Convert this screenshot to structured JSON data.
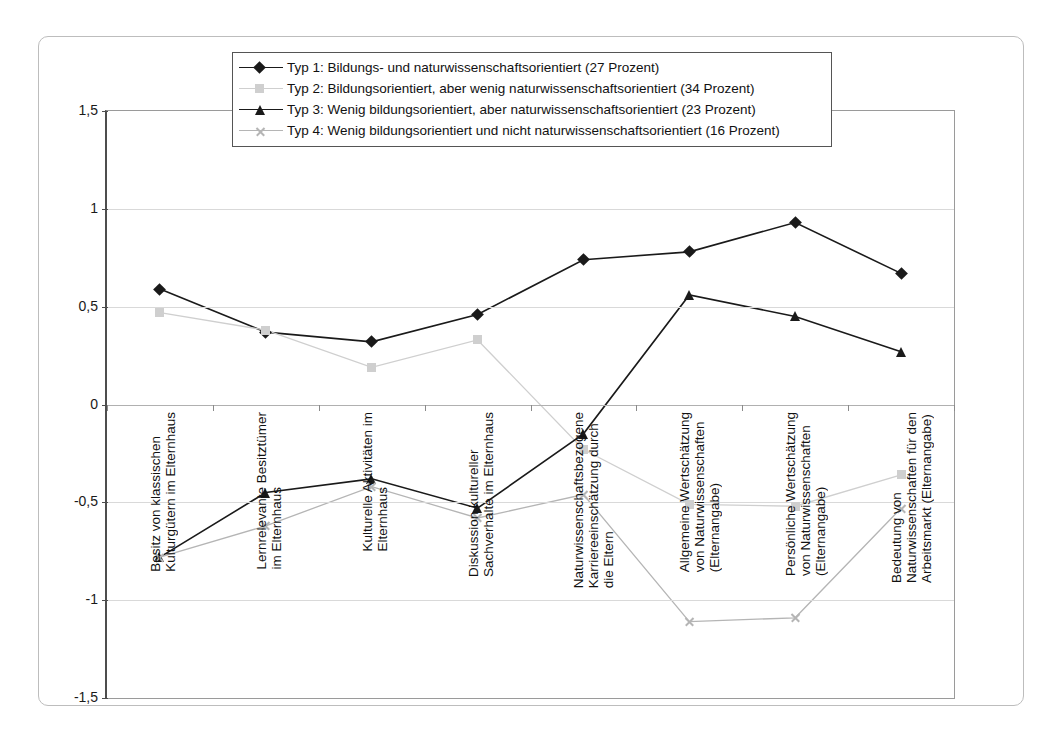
{
  "chart_data": {
    "type": "line",
    "title": "",
    "xlabel": "",
    "ylabel": "",
    "ylim": [
      -1.5,
      1.5
    ],
    "yticks": [
      "1,5",
      "1",
      "0,5",
      "0",
      "-0,5",
      "-1",
      "-1,5"
    ],
    "ytick_values": [
      1.5,
      1,
      0.5,
      0,
      -0.5,
      -1,
      -1.5
    ],
    "grid": true,
    "legend_position": "top",
    "categories": [
      "Besitz von klassischen\nKulturgütern im Elternhaus",
      "Lernrelevante Besitztümer\nim Elternhaus",
      "Kulturelle Aktivitäten im\nElternhaus",
      "Diskussion kultureller\nSachverhalte im Elternhaus",
      "Naturwissenschaftsbezogene\nKarriereeinschätzung durch\ndie Eltern",
      "Allgemeine Wertschätzung\nvon Naturwissenschaften\n(Elternangabe)",
      "Persönliche Wertschätzung\nvon Naturwissenschaften\n(Elternangabe)",
      "Bedeutung von\nNaturwissenschaften für den\nArbeitsmarkt (Elternangabe)"
    ],
    "series": [
      {
        "name": "Typ 1: Bildungs- und naturwissenschaftsorientiert (27 Prozent)",
        "marker": "diamond",
        "color": "#1a1a1a",
        "values": [
          0.59,
          0.37,
          0.32,
          0.46,
          0.74,
          0.78,
          0.93,
          0.67
        ]
      },
      {
        "name": "Typ 2: Bildungsorientiert, aber wenig naturwissenschaftsorientiert (34 Prozent)",
        "marker": "square",
        "color": "#cfcfcf",
        "values": [
          0.47,
          0.38,
          0.19,
          0.33,
          -0.23,
          -0.51,
          -0.52,
          -0.36
        ]
      },
      {
        "name": "Typ 3: Wenig bildungsorientiert, aber naturwissenschaftsorientiert (23 Prozent)",
        "marker": "triangle",
        "color": "#1a1a1a",
        "values": [
          -0.78,
          -0.45,
          -0.38,
          -0.53,
          -0.15,
          0.56,
          0.45,
          0.27
        ]
      },
      {
        "name": "Typ 4: Wenig bildungsorientiert und nicht naturwissenschaftsorientiert (16 Prozent)",
        "marker": "x",
        "color": "#b5b5b5",
        "values": [
          -0.78,
          -0.62,
          -0.42,
          -0.58,
          -0.46,
          -1.11,
          -1.09,
          -0.53
        ]
      }
    ]
  }
}
